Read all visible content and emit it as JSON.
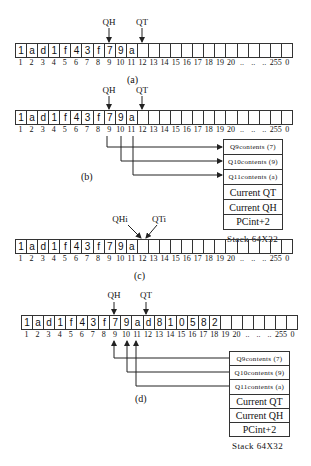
{
  "index_labels": [
    "1",
    "2",
    "3",
    "4",
    "5",
    "6",
    "7",
    "8",
    "9",
    "10",
    "11",
    "12",
    "13",
    "14",
    "15",
    "16",
    "17",
    "18",
    "19",
    "20",
    "..",
    "..",
    "..",
    "255",
    "0"
  ],
  "pointers": {
    "qh": "QH",
    "qt": "QT",
    "qhi": "QHi",
    "qti": "QTi"
  },
  "panel_a": {
    "caption": "(a)",
    "cells": [
      "1",
      "a",
      "d",
      "1",
      "f",
      "4",
      "3",
      "f",
      "7",
      "9",
      "a",
      "",
      "",
      "",
      "",
      "",
      "",
      "",
      "",
      "",
      "",
      "",
      "",
      "",
      ""
    ]
  },
  "panel_b": {
    "caption": "(b)",
    "cells": [
      "1",
      "a",
      "d",
      "1",
      "f",
      "4",
      "3",
      "f",
      "7",
      "9",
      "a",
      "",
      "",
      "",
      "",
      "",
      "",
      "",
      "",
      "",
      "",
      "",
      "",
      "",
      ""
    ],
    "stack": [
      "Q9contents (7)",
      "Q10contents (9)",
      "Q11contents (a)",
      "Current QT",
      "Current QH",
      "PCint+2"
    ],
    "stack_label": "Stack 64X32"
  },
  "panel_c": {
    "caption": "(c)",
    "cells": [
      "1",
      "a",
      "d",
      "1",
      "f",
      "4",
      "3",
      "f",
      "7",
      "9",
      "a",
      "",
      "",
      "",
      "",
      "",
      "",
      "",
      "",
      "",
      "",
      "",
      "",
      "",
      ""
    ]
  },
  "panel_d": {
    "caption": "(d)",
    "cells": [
      "1",
      "a",
      "d",
      "1",
      "f",
      "4",
      "3",
      "f",
      "7",
      "9",
      "a",
      "d",
      "8",
      "1",
      "0",
      "5",
      "8",
      "2",
      "",
      "",
      "",
      "",
      "",
      "",
      ""
    ],
    "stack": [
      "Q9contents (7)",
      "Q10contents (9)",
      "Q11contents (a)",
      "Current QT",
      "Current QH",
      "PCint+2"
    ],
    "stack_label": "Stack 64X32"
  }
}
